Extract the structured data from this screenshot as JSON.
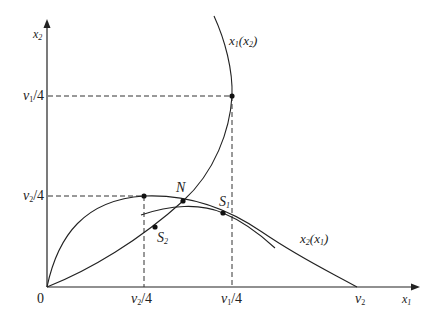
{
  "diagram": {
    "type": "reaction-curves",
    "axes": {
      "x_label": "x1",
      "y_label": "x2",
      "origin_label": "0"
    },
    "x_ticks": [
      {
        "label": "v2/4",
        "num": "v",
        "sub": "2",
        "rest": "/4"
      },
      {
        "label": "v1/4",
        "num": "v",
        "sub": "1",
        "rest": "/4"
      },
      {
        "label": "v2",
        "num": "v",
        "sub": "2",
        "rest": ""
      }
    ],
    "y_ticks": [
      {
        "label": "v1/4",
        "num": "v",
        "sub": "1",
        "rest": "/4"
      },
      {
        "label": "v2/4",
        "num": "v",
        "sub": "2",
        "rest": "/4"
      }
    ],
    "curves": [
      {
        "name": "x1(x2)",
        "base": "x",
        "sub": "1",
        "arg_base": "x",
        "arg_sub": "2"
      },
      {
        "name": "x2(x1)",
        "base": "x",
        "sub": "2",
        "arg_base": "x",
        "arg_sub": "1"
      }
    ],
    "points": [
      {
        "label": "N",
        "base": "N",
        "sub": ""
      },
      {
        "label": "S1",
        "base": "S",
        "sub": "1"
      },
      {
        "label": "S2",
        "base": "S",
        "sub": "2"
      }
    ],
    "colors": {
      "line": "#222222",
      "background": "#ffffff"
    }
  }
}
